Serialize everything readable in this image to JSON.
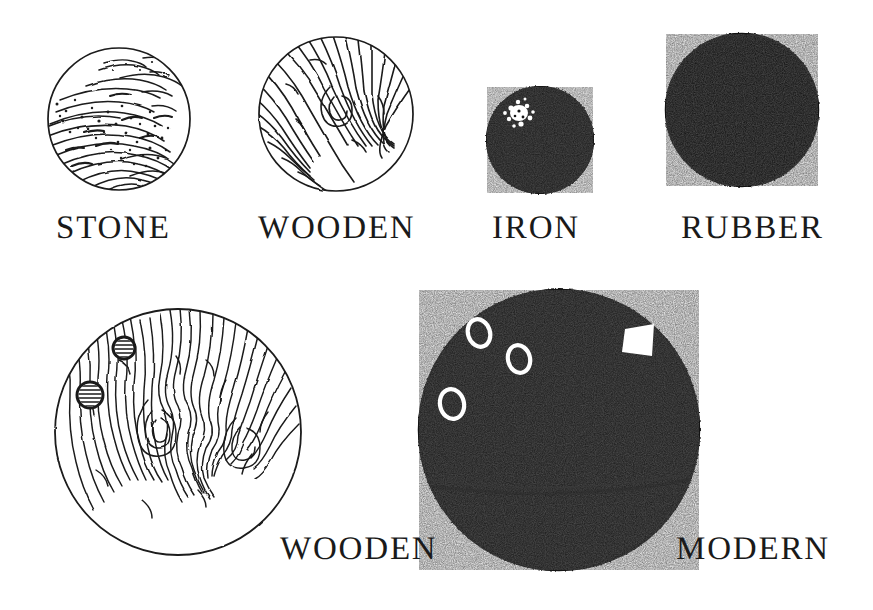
{
  "plate": {
    "title": "Bowling ball materials illustration plate",
    "background_color": "#ffffff",
    "ink_color": "#1a1a1a",
    "width": 873,
    "height": 610
  },
  "balls": [
    {
      "id": "stone",
      "label": "STONE",
      "material": "stone",
      "fill_style": "outline-with-speckled-hatching",
      "row": 1,
      "column": 1,
      "center_x": 119,
      "center_y": 119,
      "radius": 72,
      "holes": 0,
      "highlight": "none"
    },
    {
      "id": "wooden-top",
      "label": "WOODEN",
      "material": "wood",
      "fill_style": "outline-with-wood-grain",
      "row": 1,
      "column": 2,
      "center_x": 336,
      "center_y": 114,
      "radius": 78,
      "holes": 0,
      "highlight": "none"
    },
    {
      "id": "iron",
      "label": "IRON",
      "material": "iron",
      "fill_style": "solid-black",
      "row": 1,
      "column": 3,
      "center_x": 540,
      "center_y": 140,
      "radius": 54,
      "holes": 0,
      "highlight": "white-speckled-glint"
    },
    {
      "id": "rubber",
      "label": "RUBBER",
      "material": "rubber",
      "fill_style": "solid-black",
      "row": 1,
      "column": 4,
      "center_x": 742,
      "center_y": 110,
      "radius": 77,
      "holes": 0,
      "highlight": "none"
    },
    {
      "id": "wooden-bottom",
      "label": "WOODEN",
      "material": "wood",
      "fill_style": "outline-with-wood-grain",
      "row": 2,
      "column": 1,
      "center_x": 178,
      "center_y": 432,
      "radius": 124,
      "holes": 2,
      "hole_style": "hatched-circles",
      "highlight": "none"
    },
    {
      "id": "modern",
      "label": "MODERN",
      "material": "modern composite",
      "fill_style": "solid-black",
      "row": 2,
      "column": 2,
      "center_x": 559,
      "center_y": 430,
      "radius": 141,
      "holes": 3,
      "hole_style": "white-outlined-ovals",
      "highlight": "white-name-plate"
    }
  ],
  "labels": {
    "stone": "STONE",
    "wooden_top": "WOODEN",
    "iron": "IRON",
    "rubber": "RUBBER",
    "wooden_bottom": "WOODEN",
    "modern": "MODERN"
  }
}
